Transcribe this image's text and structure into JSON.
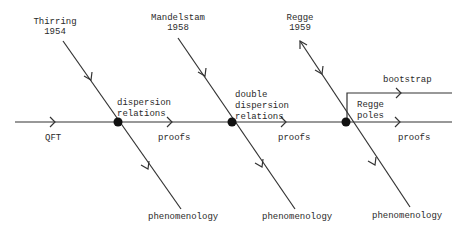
{
  "diagram": {
    "colors": {
      "line": "#333333",
      "node": "#111111",
      "text": "#2a2a2a",
      "background": "#ffffff"
    },
    "main_axis": {
      "start_label": "QFT"
    },
    "branches": [
      {
        "origin_name": "Thirring",
        "origin_year": "1954",
        "node_label": "dispersion\nrelations",
        "axis_label": "proofs",
        "outcome": "phenomenology"
      },
      {
        "origin_name": "Mandelstam",
        "origin_year": "1958",
        "node_label": "double\ndispersion\nrelations",
        "axis_label": "proofs",
        "outcome": "phenomenology"
      },
      {
        "origin_name": "Regge",
        "origin_year": "1959",
        "node_label": "Regge\npoles",
        "axis_label": "proofs",
        "outcome": "phenomenology",
        "side_branch": "bootstrap"
      }
    ]
  }
}
